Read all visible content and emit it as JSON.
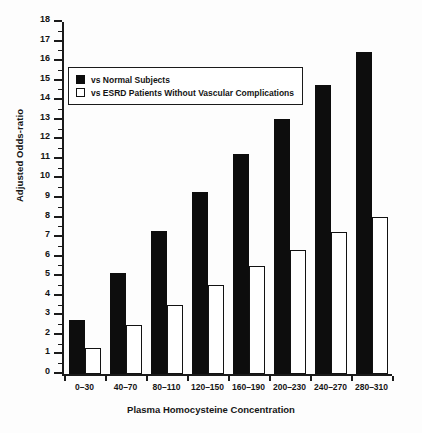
{
  "chart_data": {
    "type": "bar",
    "title": "",
    "xlabel": "Plasma Homocysteine Concentration",
    "ylabel": "Adjusted Odds-ratio",
    "categories": [
      "0–30",
      "40–70",
      "80–110",
      "120–150",
      "160–190",
      "200–230",
      "240–270",
      "280–310"
    ],
    "series": [
      {
        "name": "vs Normal Subjects",
        "style": "solid-black",
        "color": "#0d0d0d",
        "values": [
          2.75,
          5.15,
          7.3,
          9.3,
          11.25,
          13.05,
          14.8,
          16.45
        ]
      },
      {
        "name": "vs ESRD Patients Without Vascular Complications",
        "style": "open-white",
        "color": "#ffffff",
        "values": [
          1.35,
          2.5,
          3.55,
          4.55,
          5.5,
          6.35,
          7.25,
          8.05
        ]
      }
    ],
    "ylim": [
      0,
      18
    ],
    "ytick_step": 1,
    "yticks": [
      0,
      1,
      2,
      3,
      4,
      5,
      6,
      7,
      8,
      9,
      10,
      11,
      12,
      13,
      14,
      15,
      16,
      17,
      18
    ],
    "ytick_labels": [
      "0",
      "1",
      "2",
      "3",
      "4",
      "5",
      "6",
      "7",
      "8",
      "9",
      "10",
      "11",
      "12",
      "13",
      "14",
      "15",
      "16",
      "17",
      "18"
    ],
    "grid": false,
    "legend_position": "upper-left-inside"
  },
  "legend": {
    "entries": [
      {
        "label": "vs Normal Subjects",
        "swatch": "filled-square"
      },
      {
        "label": "vs ESRD Patients Without Vascular Complications",
        "swatch": "open-square"
      }
    ]
  }
}
